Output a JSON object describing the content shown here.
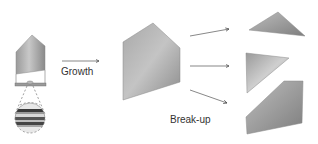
{
  "diagram": {
    "labels": {
      "growth": "Growth",
      "breakup": "Break-up"
    },
    "colors": {
      "shape_light": "#c8c8c8",
      "shape_dark": "#7a7a7a",
      "arrow": "#555555",
      "text": "#333333",
      "band_dark": "#3a3a3a",
      "band_mid": "#8a8a8a",
      "band_light": "#d8d8d8"
    },
    "stages": [
      {
        "id": "seed",
        "description": "small crystal on substrate with magnified layered inset"
      },
      {
        "id": "grown",
        "description": "large grown crystal"
      },
      {
        "id": "fragments",
        "description": "three broken-up fragments",
        "count": 3
      }
    ]
  }
}
